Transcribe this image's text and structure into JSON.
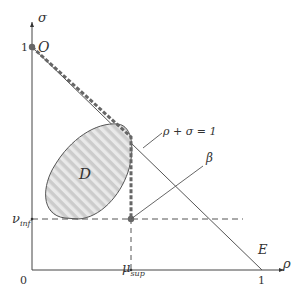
{
  "diagram": {
    "axes": {
      "y_label": "σ",
      "x_label": "ρ",
      "origin_label": "0",
      "y_tick_one": "1",
      "x_tick_one": "1"
    },
    "points": {
      "O": "O",
      "E": "E"
    },
    "region_label": "D",
    "line_label": "ρ + σ = 1",
    "beta_label": "β",
    "nu_inf": {
      "symbol": "ν",
      "subscript": "inf"
    },
    "mu_sup": {
      "symbol": "μ",
      "subscript": "sup"
    },
    "colors": {
      "line": "#555555",
      "dashed_path": "#666666",
      "region_fill": "#cfcfcf",
      "region_stripe": "#e8e8e8"
    }
  }
}
